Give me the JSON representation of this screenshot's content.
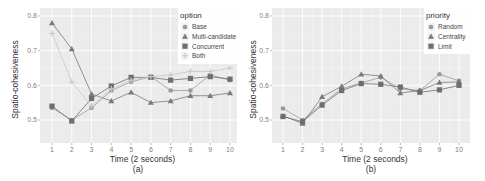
{
  "chart_data": [
    {
      "type": "line",
      "title": "",
      "subtitle": "(a)",
      "xlabel": "Time (2 seconds)",
      "ylabel": "Spatio-cohesiveness",
      "x": [
        1,
        2,
        3,
        4,
        5,
        6,
        7,
        8,
        9,
        10
      ],
      "yticks": [
        0.5,
        0.6,
        0.7,
        0.8
      ],
      "ylim": [
        0.43,
        0.82
      ],
      "grid": true,
      "legend_title": "option",
      "legend_position": "top-right inside",
      "series": [
        {
          "name": "Base",
          "marker": "circle",
          "values": [
            0.535,
            0.5,
            0.535,
            0.585,
            0.61,
            0.625,
            0.585,
            0.585,
            0.63,
            0.615
          ]
        },
        {
          "name": "Multi-candidate",
          "marker": "triangle",
          "values": [
            0.78,
            0.705,
            0.575,
            0.555,
            0.58,
            0.55,
            0.555,
            0.57,
            0.57,
            0.578
          ]
        },
        {
          "name": "Concurrent",
          "marker": "square",
          "values": [
            0.54,
            0.497,
            0.562,
            0.598,
            0.623,
            0.623,
            0.615,
            0.62,
            0.625,
            0.618
          ]
        },
        {
          "name": "Both",
          "marker": "cross",
          "values": [
            0.75,
            0.61,
            0.54,
            0.59,
            0.615,
            0.625,
            0.63,
            0.64,
            0.64,
            0.65
          ]
        }
      ]
    },
    {
      "type": "line",
      "title": "",
      "subtitle": "(b)",
      "xlabel": "Time (2 seconds)",
      "ylabel": "Spatio-cohesiveness",
      "x": [
        1,
        2,
        3,
        4,
        5,
        6,
        7,
        8,
        9,
        10
      ],
      "yticks": [
        0.5,
        0.6,
        0.7,
        0.8
      ],
      "ylim": [
        0.43,
        0.82
      ],
      "grid": true,
      "legend_title": "priority",
      "legend_position": "top-right inside",
      "series": [
        {
          "name": "Random",
          "marker": "circle",
          "values": [
            0.533,
            0.5,
            0.547,
            0.59,
            0.607,
            0.623,
            0.59,
            0.585,
            0.632,
            0.613
          ]
        },
        {
          "name": "Centrality",
          "marker": "triangle",
          "values": [
            0.512,
            0.49,
            0.567,
            0.597,
            0.632,
            0.627,
            0.578,
            0.585,
            0.608,
            0.61
          ]
        },
        {
          "name": "Limit",
          "marker": "square",
          "values": [
            0.51,
            0.495,
            0.543,
            0.585,
            0.605,
            0.603,
            0.595,
            0.58,
            0.587,
            0.6
          ]
        }
      ]
    }
  ],
  "colors": {
    "panel_bg": "#ebebeb",
    "grid": "#ffffff",
    "series": [
      "#9a9a9a",
      "#7a7a7a",
      "#6e6e6e",
      "#c8c8c8"
    ]
  }
}
